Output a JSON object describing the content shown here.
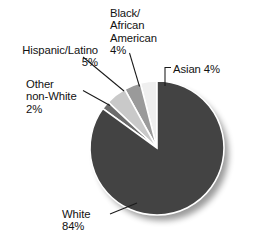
{
  "chart_data": {
    "type": "pie",
    "title": "",
    "subtitle": "",
    "xlabel": "",
    "ylabel": "",
    "legend_position": "none",
    "grid": false,
    "labels_on_slices": false,
    "total": 99,
    "units": "percent",
    "categories": [
      "White",
      "Hispanic/Latino",
      "Black/African American",
      "Asian",
      "Other non-White"
    ],
    "values": [
      84,
      5,
      4,
      4,
      2
    ],
    "colors": [
      "#434343",
      "#c9c9c9",
      "#9a9a9a",
      "#efefef",
      "#6d6d6d"
    ],
    "slices": [
      {
        "name": "asian",
        "label": "Asian 4%",
        "category": "Asian",
        "value": 4,
        "value_text": "4%",
        "color": "#efefef",
        "start_angle": 0,
        "end_angle": 14.4
      },
      {
        "name": "black-african-american",
        "label": "Black/\nAfrican\nAmerican\n4%",
        "category": "Black/African American",
        "value": 4,
        "value_text": "4%",
        "color": "#9a9a9a",
        "start_angle": 14.4,
        "end_angle": 28.8
      },
      {
        "name": "hispanic-latino",
        "label": "Hispanic/Latino\n5%",
        "category": "Hispanic/Latino",
        "value": 5,
        "value_text": "5%",
        "color": "#c9c9c9",
        "start_angle": 28.8,
        "end_angle": 46.8
      },
      {
        "name": "other-non-white",
        "label": "Other\nnon-White\n2%",
        "category": "Other non-White",
        "value": 2,
        "value_text": "2%",
        "color": "#6d6d6d",
        "start_angle": 46.8,
        "end_angle": 54
      },
      {
        "name": "white",
        "label": "White\n84%",
        "category": "White",
        "value": 84,
        "value_text": "84%",
        "color": "#434343",
        "start_angle": 54,
        "end_angle": 360
      }
    ]
  },
  "labels": {
    "black_african_american": "Black/\nAfrican\nAmerican\n4%",
    "hispanic_latino": "Hispanic/Latino\n5%",
    "other_non_white": "Other\nnon-White\n2%",
    "asian": "Asian 4%",
    "white": "White\n84%"
  },
  "style": {
    "background": "#ffffff",
    "text_color": "#121212",
    "leader_line_color": "#1a1a1a",
    "separator_color": "#ffffff",
    "shadow_color": "#cfcfcf"
  }
}
